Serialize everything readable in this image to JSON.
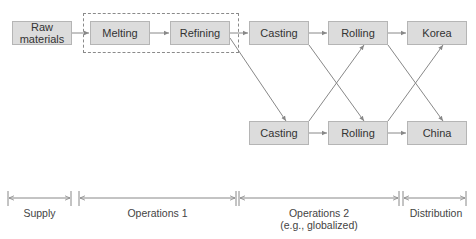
{
  "diagram": {
    "type": "supply-chain-flow",
    "colors": {
      "node_fill": "#dcdcdc",
      "node_border": "#b5b5b5",
      "line": "#888888",
      "text": "#333333"
    },
    "nodes": {
      "raw_materials": "Raw\nmaterials",
      "melting": "Melting",
      "refining": "Refining",
      "casting_top": "Casting",
      "rolling_top": "Rolling",
      "korea": "Korea",
      "casting_bottom": "Casting",
      "rolling_bottom": "Rolling",
      "china": "China"
    },
    "edges": [
      [
        "Raw materials",
        "Melting"
      ],
      [
        "Melting",
        "Refining"
      ],
      [
        "Refining",
        "Casting (top)"
      ],
      [
        "Refining",
        "Casting (bottom)"
      ],
      [
        "Casting (top)",
        "Rolling (top)"
      ],
      [
        "Casting (top)",
        "Rolling (bottom)"
      ],
      [
        "Casting (bottom)",
        "Rolling (top)"
      ],
      [
        "Casting (bottom)",
        "Rolling (bottom)"
      ],
      [
        "Rolling (top)",
        "Korea"
      ],
      [
        "Rolling (top)",
        "China"
      ],
      [
        "Rolling (bottom)",
        "Korea"
      ],
      [
        "Rolling (bottom)",
        "China"
      ]
    ],
    "group": "Melting + Refining (dashed box)",
    "phases": {
      "supply": "Supply",
      "operations1": "Operations 1",
      "operations2_line1": "Operations 2",
      "operations2_line2": "(e.g., globalized)",
      "distribution": "Distribution"
    }
  }
}
